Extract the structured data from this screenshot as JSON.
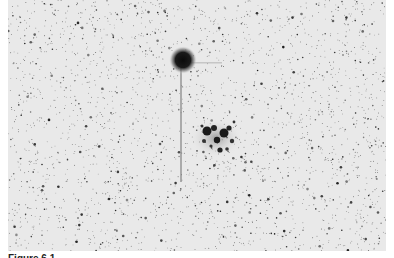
{
  "figure": {
    "type": "negative astronomical photograph",
    "subjects": [
      {
        "name": "comet-head",
        "description": "bright fuzzy coma near top center with faint tail extending downward"
      },
      {
        "name": "star-cluster",
        "description": "compact open cluster of bright stars below and right of the comet"
      }
    ],
    "colors": {
      "background": "#e9e9e9",
      "stars": "#1a1a1a"
    }
  },
  "caption": {
    "label": "Figure 6.1",
    "text": ""
  }
}
